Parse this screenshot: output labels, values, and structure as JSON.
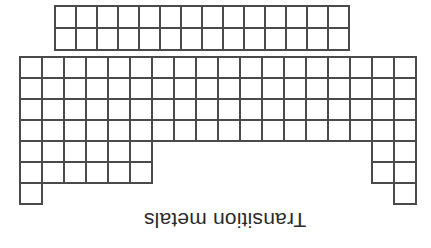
{
  "figure": {
    "title_label": "Transition metals",
    "orientation": "rotated-180",
    "background_color": "#ffffff",
    "line_color": "#4a4a4a",
    "text_color": "#2b2b2b"
  },
  "diagram": {
    "kind": "periodic-table-outline",
    "main_block": {
      "name": "main-periodic-grid",
      "columns": 18,
      "rows": 7,
      "cell_width": 22,
      "cell_height": 21,
      "origin_x": 20,
      "origin_y": 57,
      "row_spans": [
        {
          "row": 0,
          "start_col": 0,
          "end_col": 18
        },
        {
          "row": 1,
          "start_col": 0,
          "end_col": 18
        },
        {
          "row": 2,
          "start_col": 0,
          "end_col": 18
        },
        {
          "row": 3,
          "start_col": 0,
          "end_col": 18
        },
        {
          "row": 4,
          "start_col": 0,
          "end_col": 18
        },
        {
          "row": 5,
          "start_col": 0,
          "end_col": 18
        }
      ],
      "partial_rows": [
        {
          "row": 4,
          "segments": [
            [
              0,
              6
            ],
            [
              16,
              18
            ]
          ]
        },
        {
          "row": 5,
          "segments": [
            [
              0,
              6
            ],
            [
              16,
              18
            ]
          ]
        },
        {
          "row": 6,
          "segments": [
            [
              0,
              1
            ],
            [
              17,
              18
            ]
          ]
        }
      ],
      "full_rows": [
        0,
        1,
        2,
        3
      ]
    },
    "inner_block": {
      "name": "lanthanide-actinide-strip",
      "columns": 14,
      "rows": 2,
      "cell_width": 21,
      "cell_height": 22,
      "origin_x": 55,
      "origin_y": 6
    }
  },
  "annotation": {
    "text": "Transition metals",
    "x": 225,
    "y": 213,
    "rotation_degrees": 180
  }
}
